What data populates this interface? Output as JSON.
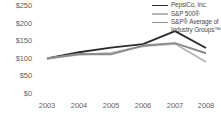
{
  "chart_data": {
    "type": "line",
    "title": "",
    "subtitle": "",
    "xlabel": "",
    "ylabel": "",
    "categories": [
      "2003",
      "2004",
      "2005",
      "2006",
      "2007",
      "2008"
    ],
    "x_tick_labels": [
      "2003",
      "2004",
      "2005",
      "2006",
      "2007",
      "2008"
    ],
    "y_tick_labels": [
      "$250",
      "$200",
      "$150",
      "$100",
      "$50",
      "$0"
    ],
    "y_tick_values": [
      250,
      200,
      150,
      100,
      50,
      0
    ],
    "ylim": [
      0,
      250
    ],
    "grid": false,
    "legend_position": "top-right",
    "series": [
      {
        "name": "PepsiCo, Inc.",
        "color": "#2b2b2b",
        "values": [
          100,
          118,
          131,
          141,
          178,
          130
        ]
      },
      {
        "name": "S&P 500®",
        "color": "#b6b6b6",
        "values": [
          100,
          111,
          116,
          135,
          142,
          90
        ]
      },
      {
        "name": "S&P® Average of Industry Groups™",
        "color": "#8b8b8b",
        "values": [
          100,
          113,
          112,
          137,
          144,
          115
        ]
      }
    ]
  },
  "legend": {
    "items": [
      {
        "label": "PepsiCo, Inc.",
        "label2": "",
        "color": "#2b2b2b"
      },
      {
        "label": "S&P 500®",
        "label2": "",
        "color": "#b6b6b6"
      },
      {
        "label": "S&P® Average of",
        "label2": "Industry Groups™",
        "color": "#8b8b8b"
      }
    ]
  },
  "axes": {
    "y": [
      {
        "label": "$250",
        "top": 2
      },
      {
        "label": "$200",
        "top": 19.5
      },
      {
        "label": "$150",
        "top": 37
      },
      {
        "label": "$100",
        "top": 54.5
      },
      {
        "label": "$50",
        "top": 72
      },
      {
        "label": "$0",
        "top": 89.5
      }
    ],
    "x": [
      {
        "label": "2003",
        "left": 47
      },
      {
        "label": "2004",
        "left": 79
      },
      {
        "label": "2005",
        "left": 111
      },
      {
        "label": "2006",
        "left": 143
      },
      {
        "label": "2007",
        "left": 175
      },
      {
        "label": "2008",
        "left": 206
      }
    ]
  }
}
